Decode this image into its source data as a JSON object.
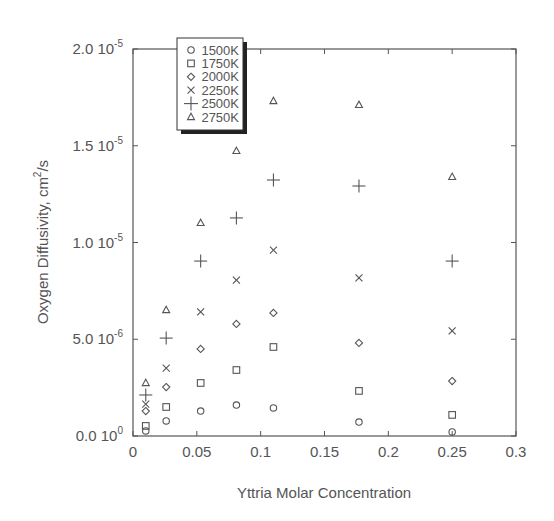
{
  "chart_data": {
    "type": "scatter",
    "title": "",
    "xlabel": "Yttria Molar Concentration",
    "ylabel": "Oxygen Diffusivity, cm²/s",
    "ylabel_parts": {
      "main": "Oxygen Diffusivity, cm",
      "sup": "2",
      "tail": "/s"
    },
    "xlim": [
      0,
      0.3
    ],
    "ylim": [
      0,
      2e-05
    ],
    "grid": false,
    "legend_position": "upper-left (inside)",
    "x_ticks": [
      {
        "value": 0,
        "label": "0"
      },
      {
        "value": 0.05,
        "label": "0.05"
      },
      {
        "value": 0.1,
        "label": "0.1"
      },
      {
        "value": 0.15,
        "label": "0.15"
      },
      {
        "value": 0.2,
        "label": "0.2"
      },
      {
        "value": 0.25,
        "label": "0.25"
      },
      {
        "value": 0.3,
        "label": "0.3"
      }
    ],
    "y_ticks": [
      {
        "value": 0,
        "mant": "0.0 10",
        "exp": "0"
      },
      {
        "value": 5e-06,
        "mant": "5.0 10",
        "exp": "-6"
      },
      {
        "value": 1e-05,
        "mant": "1.0 10",
        "exp": "-5"
      },
      {
        "value": 1.5e-05,
        "mant": "1.5 10",
        "exp": "-5"
      },
      {
        "value": 2e-05,
        "mant": "2.0 10",
        "exp": "-5"
      }
    ],
    "x": [
      0.01,
      0.026,
      0.053,
      0.081,
      0.11,
      0.177,
      0.25
    ],
    "series": [
      {
        "name": "1500K",
        "marker": "circle",
        "values": [
          2.6e-07,
          7.8e-07,
          1.29e-06,
          1.6e-06,
          1.45e-06,
          7.2e-07,
          2.1e-07
        ]
      },
      {
        "name": "1750K",
        "marker": "square",
        "values": [
          5.2e-07,
          1.5e-06,
          2.74e-06,
          3.41e-06,
          4.6e-06,
          2.33e-06,
          1.09e-06
        ]
      },
      {
        "name": "2000K",
        "marker": "diamond",
        "values": [
          1.29e-06,
          2.53e-06,
          4.5e-06,
          5.79e-06,
          6.36e-06,
          4.81e-06,
          2.84e-06
        ]
      },
      {
        "name": "2250K",
        "marker": "x",
        "values": [
          1.65e-06,
          3.51e-06,
          6.41e-06,
          8.06e-06,
          9.61e-06,
          8.17e-06,
          5.43e-06
        ]
      },
      {
        "name": "2500K",
        "marker": "plus",
        "values": [
          2.12e-06,
          5.06e-06,
          9.04e-06,
          1.127e-05,
          1.323e-05,
          1.292e-05,
          9.04e-06
        ]
      },
      {
        "name": "2750K",
        "marker": "triangle",
        "values": [
          2.74e-06,
          6.51e-06,
          1.101e-05,
          1.473e-05,
          1.731e-05,
          1.711e-05,
          1.339e-05
        ]
      }
    ]
  },
  "colors": {
    "axis": "#555555",
    "marker": "#555555",
    "background": "#ffffff"
  }
}
